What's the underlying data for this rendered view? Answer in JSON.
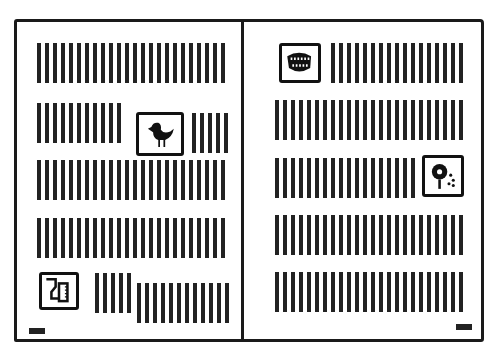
{
  "diagram": {
    "type": "open-book-spread-layout",
    "colors": {
      "ink": "#1a1a1a",
      "paper": "#ffffff"
    },
    "left_page": {
      "rows": [
        {
          "kind": "text-lines",
          "count": 24
        },
        {
          "kind": "text-lines-with-image",
          "image": "bird-icon",
          "image_position": "right"
        },
        {
          "kind": "text-lines",
          "count": 24
        },
        {
          "kind": "text-lines",
          "count": 24
        },
        {
          "kind": "text-lines-with-image",
          "image": "glass-and-bottle-icon",
          "image_position": "left"
        }
      ],
      "folio_position": "bottom-left"
    },
    "right_page": {
      "rows": [
        {
          "kind": "text-lines-with-image",
          "image": "mouth-teeth-icon",
          "image_position": "left"
        },
        {
          "kind": "text-lines",
          "count": 24
        },
        {
          "kind": "text-lines-with-image",
          "image": "flower-icon",
          "image_position": "right"
        },
        {
          "kind": "text-lines",
          "count": 24
        },
        {
          "kind": "text-lines",
          "count": 24
        }
      ],
      "folio_position": "bottom-right"
    }
  }
}
